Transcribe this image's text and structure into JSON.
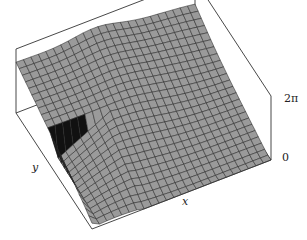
{
  "chart_data": {
    "type": "surface3d",
    "title": "",
    "xlabel": "x",
    "ylabel": "y",
    "zlabel": "",
    "z_ticks": [
      "0",
      "2π"
    ],
    "zlim": [
      0,
      6.2832
    ],
    "grid_resolution": [
      24,
      24
    ],
    "surface_color": "#9a9a9a",
    "mesh_color": "#2a2a2a",
    "cliff_color": "#111111",
    "box_color": "#333333"
  },
  "labels": {
    "x": "x",
    "y": "y",
    "z_top": "2π",
    "z_bottom": "0"
  }
}
